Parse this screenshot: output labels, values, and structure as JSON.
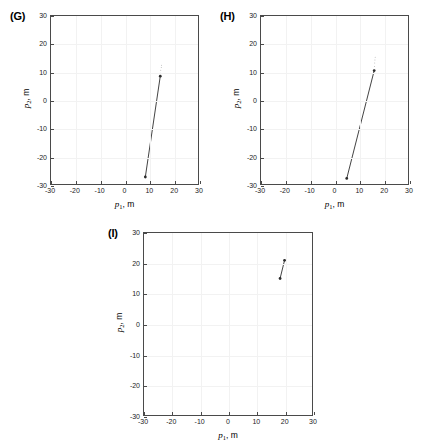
{
  "figure": {
    "background": "#ffffff",
    "line_color": "#2b2b2b",
    "grid_color": "#f2f2f2",
    "axis_color": "#4a4a4a"
  },
  "axis_label_x": {
    "var": "p",
    "sub": "1",
    "unit": ", m"
  },
  "axis_label_y": {
    "var": "p",
    "sub": "2",
    "unit": ", m"
  },
  "ticks": {
    "x": [
      "-30",
      "-20",
      "-10",
      "0",
      "10",
      "20",
      "30"
    ],
    "y": [
      "30",
      "20",
      "10",
      "0",
      "-10",
      "-20",
      "-30"
    ]
  },
  "panels": [
    {
      "label": "(G)"
    },
    {
      "label": "(H)"
    },
    {
      "label": "(I)"
    }
  ],
  "chart_data": [
    {
      "type": "line",
      "title": "(G)",
      "xlabel": "p_1, m",
      "ylabel": "p_2, m",
      "xlim": [
        -30,
        30
      ],
      "ylim": [
        -30,
        30
      ],
      "xticks": [
        -30,
        -20,
        -10,
        0,
        10,
        20,
        30
      ],
      "yticks": [
        -30,
        -20,
        -10,
        0,
        10,
        20,
        30
      ],
      "grid": true,
      "legend": "none",
      "series": [
        {
          "name": "trajectory",
          "x": [
            8.5,
            14.6
          ],
          "y": [
            -27.5,
            8.5
          ],
          "marker": "dot",
          "marker_ends": true
        },
        {
          "name": "endpoint-cluster",
          "x": [
            14.6,
            14.8,
            15.0,
            15.1
          ],
          "y": [
            9.6,
            10.6,
            11.6,
            12.4
          ],
          "marker": "dotted-faint",
          "marker_ends": false
        }
      ]
    },
    {
      "type": "line",
      "title": "(H)",
      "xlabel": "p_1, m",
      "ylabel": "p_2, m",
      "xlim": [
        -30,
        30
      ],
      "ylim": [
        -30,
        30
      ],
      "xticks": [
        -30,
        -20,
        -10,
        0,
        10,
        20,
        30
      ],
      "yticks": [
        -30,
        -20,
        -10,
        0,
        10,
        20,
        30
      ],
      "grid": true,
      "legend": "none",
      "series": [
        {
          "name": "trajectory",
          "x": [
            5.0,
            16.2
          ],
          "y": [
            -28.0,
            10.5
          ],
          "marker": "dot",
          "marker_ends": true
        },
        {
          "name": "endpoint-cluster",
          "x": [
            16.3,
            16.4,
            16.5,
            16.6
          ],
          "y": [
            12.0,
            13.2,
            14.3,
            15.3
          ],
          "marker": "dotted-faint",
          "marker_ends": false
        }
      ]
    },
    {
      "type": "line",
      "title": "(I)",
      "xlabel": "p_1, m",
      "ylabel": "p_2, m",
      "xlim": [
        -30,
        30
      ],
      "ylim": [
        -30,
        30
      ],
      "xticks": [
        -30,
        -20,
        -10,
        0,
        10,
        20,
        30
      ],
      "yticks": [
        -30,
        -20,
        -10,
        0,
        10,
        20,
        30
      ],
      "grid": true,
      "legend": "none",
      "series": [
        {
          "name": "trajectory",
          "x": [
            18.6,
            20.2
          ],
          "y": [
            15.0,
            21.0
          ],
          "marker": "dot",
          "marker_ends": true
        }
      ]
    }
  ]
}
